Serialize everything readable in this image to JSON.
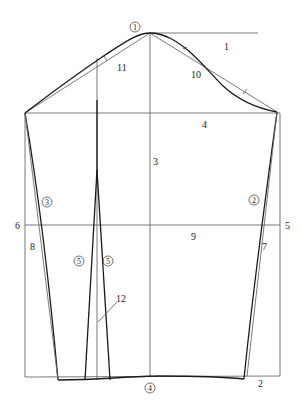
{
  "diagram": {
    "title": "",
    "type": "sleeve-pattern-draft",
    "colors": {
      "construction_line": "#6a6a6a",
      "outline": "#1a1a1a",
      "background": "#ffffff"
    },
    "numeric_labels": {
      "l1": "1",
      "l2": "2",
      "l3": "3",
      "l4": "4",
      "l5": "5",
      "l6": "6",
      "l7": "7",
      "l8": "8",
      "l9": "9",
      "l10": "10",
      "l11": "11",
      "l12": "12"
    },
    "circled_labels": {
      "c1": "1",
      "c2": "2",
      "c3": "3",
      "c4": "4",
      "c5a": "5",
      "c5b": "5"
    }
  }
}
